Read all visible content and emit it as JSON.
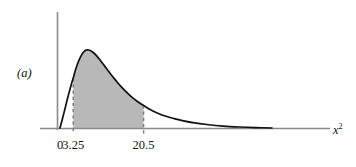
{
  "figure": {
    "panel_label": "(a)",
    "axis_title_base": "x",
    "axis_title_exponent": "2",
    "background_color": "#ffffff",
    "curve_color": "#111111",
    "shade_color": "#b8b8b8",
    "axis_color": "#8a8a8a",
    "dash_color": "#7d7d7d"
  },
  "chart_data": {
    "type": "area",
    "title": "",
    "subtitle": "",
    "xlabel": "x²",
    "ylabel": "",
    "grid": false,
    "legend": null,
    "annotations": [
      {
        "name": "panel-label",
        "text": "(a)",
        "x_px": 17,
        "y_px": 67
      }
    ],
    "axis": {
      "x_tick_labels": [
        "0",
        "3.25",
        "20.5"
      ],
      "x_tick_values": [
        0,
        3.25,
        20.5
      ],
      "y_tick_labels": [],
      "xlim": [
        0,
        52
      ],
      "ylim": [
        0,
        1.05
      ]
    },
    "shaded_region": {
      "label": "",
      "from": 3.25,
      "to": 20.5,
      "color": "#b8b8b8",
      "boundary_style": "dashed"
    },
    "series": [
      {
        "name": "chi-square density",
        "type": "line",
        "color": "#111111",
        "x": [
          0,
          1,
          2,
          3,
          3.25,
          4,
          5,
          6,
          7,
          8,
          9,
          10,
          11,
          12,
          13,
          14,
          15,
          16,
          17,
          18,
          19,
          20,
          20.5,
          22,
          24,
          26,
          28,
          30,
          33,
          36,
          40,
          44,
          48,
          52
        ],
        "y": [
          0.0,
          0.2,
          0.41,
          0.6,
          0.64,
          0.78,
          0.91,
          0.985,
          1.0,
          0.975,
          0.925,
          0.86,
          0.79,
          0.72,
          0.655,
          0.59,
          0.53,
          0.475,
          0.425,
          0.38,
          0.34,
          0.305,
          0.29,
          0.24,
          0.19,
          0.15,
          0.12,
          0.095,
          0.065,
          0.045,
          0.025,
          0.013,
          0.005,
          0.0
        ]
      }
    ]
  }
}
